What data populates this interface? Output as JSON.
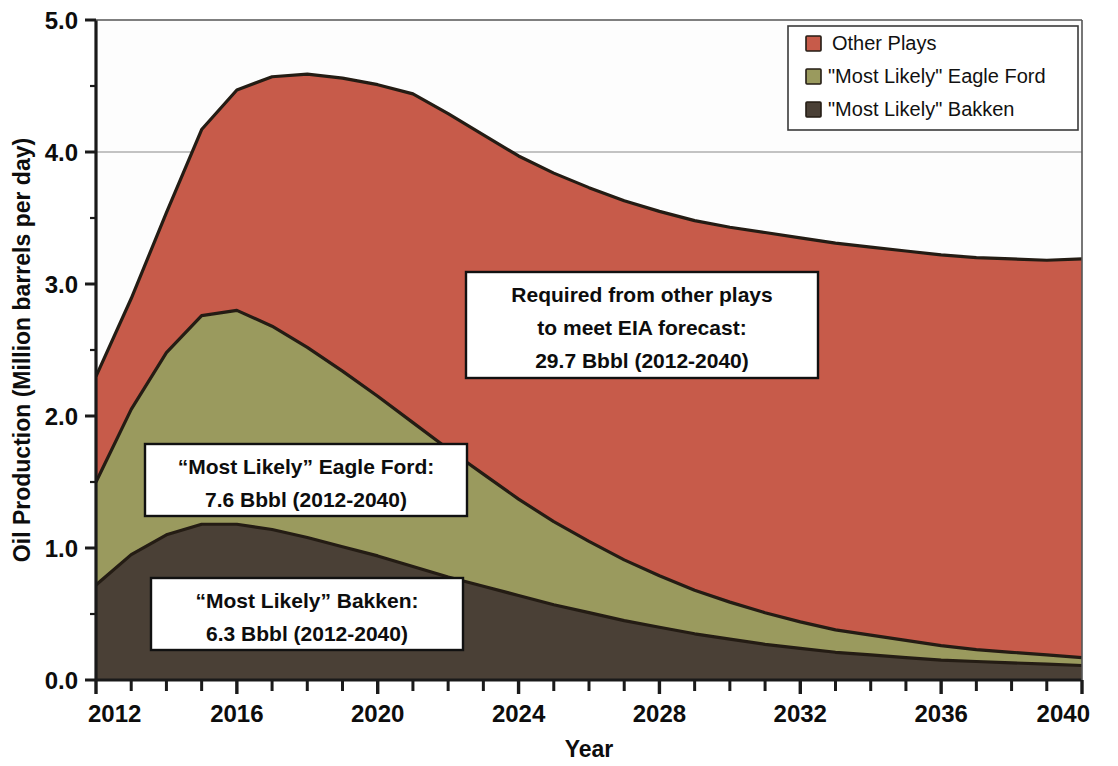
{
  "chart_data": {
    "type": "area",
    "stacked": true,
    "title": "",
    "xlabel": "Year",
    "ylabel": "Oil Production (Million barrels per day)",
    "xlim": [
      2012,
      2040
    ],
    "ylim": [
      0.0,
      5.0
    ],
    "ytick_labels": [
      "0.0",
      "1.0",
      "2.0",
      "3.0",
      "4.0",
      "5.0"
    ],
    "ytick_values": [
      0.0,
      1.0,
      2.0,
      3.0,
      4.0,
      5.0
    ],
    "xtick_labels": [
      "2012",
      "2016",
      "2020",
      "2024",
      "2028",
      "2032",
      "2036",
      "2040"
    ],
    "xtick_values": [
      2012,
      2016,
      2020,
      2024,
      2028,
      2032,
      2036,
      2040
    ],
    "minor_xticks_every": 1,
    "grid": "horizontal-only-at-4.0",
    "legend_position": "top-right",
    "x": [
      2012,
      2013,
      2014,
      2015,
      2016,
      2017,
      2018,
      2019,
      2020,
      2021,
      2022,
      2023,
      2024,
      2025,
      2026,
      2027,
      2028,
      2029,
      2030,
      2031,
      2032,
      2033,
      2034,
      2035,
      2036,
      2037,
      2038,
      2039,
      2040
    ],
    "categories": [
      2012,
      2013,
      2014,
      2015,
      2016,
      2017,
      2018,
      2019,
      2020,
      2021,
      2022,
      2023,
      2024,
      2025,
      2026,
      2027,
      2028,
      2029,
      2030,
      2031,
      2032,
      2033,
      2034,
      2035,
      2036,
      2037,
      2038,
      2039,
      2040
    ],
    "series": [
      {
        "name": "\"Most Likely\" Bakken",
        "color": "#4a4036",
        "stack_order": 1,
        "values": [
          0.72,
          0.95,
          1.1,
          1.18,
          1.18,
          1.14,
          1.08,
          1.01,
          0.94,
          0.86,
          0.78,
          0.71,
          0.64,
          0.57,
          0.51,
          0.45,
          0.4,
          0.35,
          0.31,
          0.27,
          0.24,
          0.21,
          0.19,
          0.17,
          0.15,
          0.14,
          0.13,
          0.12,
          0.11
        ]
      },
      {
        "name": "\"Most Likely\" Eagle Ford",
        "color": "#9a9a5e",
        "stack_order": 2,
        "values": [
          0.78,
          1.1,
          1.38,
          1.58,
          1.62,
          1.54,
          1.44,
          1.33,
          1.21,
          1.09,
          0.97,
          0.85,
          0.73,
          0.63,
          0.54,
          0.46,
          0.39,
          0.33,
          0.28,
          0.24,
          0.2,
          0.17,
          0.15,
          0.13,
          0.11,
          0.09,
          0.08,
          0.07,
          0.06
        ]
      },
      {
        "name": "Other Plays",
        "color": "#c75b4a",
        "stack_order": 3,
        "values": [
          0.8,
          0.84,
          1.06,
          1.41,
          1.67,
          1.89,
          2.07,
          2.22,
          2.36,
          2.49,
          2.54,
          2.57,
          2.6,
          2.64,
          2.68,
          2.72,
          2.76,
          2.8,
          2.84,
          2.88,
          2.91,
          2.93,
          2.94,
          2.95,
          2.96,
          2.97,
          2.98,
          2.99,
          3.02
        ]
      }
    ],
    "stacked_totals": [
      2.3,
      2.89,
      3.54,
      4.17,
      4.47,
      4.57,
      4.59,
      4.56,
      4.51,
      4.44,
      4.29,
      4.13,
      3.97,
      3.84,
      3.73,
      3.63,
      3.55,
      3.48,
      3.43,
      3.39,
      3.35,
      3.31,
      3.28,
      3.25,
      3.22,
      3.2,
      3.19,
      3.18,
      3.19
    ],
    "annotations": [
      {
        "id": "other-plays-annotation",
        "lines": [
          "Required from other plays",
          "to meet EIA forecast:",
          "29.7 Bbbl (2012-2040)"
        ]
      },
      {
        "id": "eagle-ford-annotation",
        "lines": [
          "“Most Likely” Eagle Ford:",
          "7.6 Bbbl (2012-2040)"
        ]
      },
      {
        "id": "bakken-annotation",
        "lines": [
          "“Most Likely” Bakken:",
          "6.3 Bbbl (2012-2040)"
        ]
      }
    ]
  },
  "axes": {
    "y_title": "Oil Production (Million barrels per day)",
    "x_title": "Year",
    "y_ticks": [
      "5.0",
      "4.0",
      "3.0",
      "2.0",
      "1.0",
      "0.0"
    ],
    "x_ticks": [
      "2012",
      "2016",
      "2020",
      "2024",
      "2028",
      "2032",
      "2036",
      "2040"
    ]
  },
  "legend": {
    "items": [
      {
        "label": "Other Plays",
        "color": "#c75b4a"
      },
      {
        "label": "\"Most Likely\" Eagle Ford",
        "color": "#9a9a5e"
      },
      {
        "label": "\"Most Likely\" Bakken",
        "color": "#4a4036"
      }
    ]
  },
  "annotations": {
    "other_plays": {
      "line1": "Required from other plays",
      "line2": "to meet EIA forecast:",
      "line3": "29.7 Bbbl (2012-2040)"
    },
    "eagle_ford": {
      "line1": "“Most Likely” Eagle Ford:",
      "line2": "7.6 Bbbl (2012-2040)"
    },
    "bakken": {
      "line1": "“Most Likely” Bakken:",
      "line2": "6.3 Bbbl (2012-2040)"
    }
  },
  "colors": {
    "other_plays": "#c75b4a",
    "eagle_ford": "#9a9a5e",
    "bakken": "#4a4036",
    "outline": "#241c14",
    "axis": "#1a1a1a",
    "background": "#ffffff"
  }
}
